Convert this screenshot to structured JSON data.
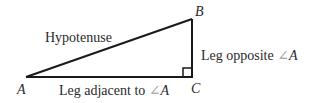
{
  "diagram": {
    "title": "",
    "vertices": [
      {
        "id": "A",
        "label": "A",
        "x": 26,
        "y": 77
      },
      {
        "id": "B",
        "label": "B",
        "x": 192,
        "y": 19
      },
      {
        "id": "C",
        "label": "C",
        "x": 192,
        "y": 77
      }
    ],
    "edges": [
      {
        "from": "A",
        "to": "B",
        "label": "Hypotenuse"
      },
      {
        "from": "B",
        "to": "C",
        "label_prefix": "Leg opposite ",
        "angle_symbol": "∠",
        "angle_vertex": "A"
      },
      {
        "from": "A",
        "to": "C",
        "label_prefix": "Leg adjacent to ",
        "angle_symbol": "∠",
        "angle_vertex": "A"
      }
    ],
    "right_angle_at": "C",
    "colors": {
      "line": "#1a1a1a",
      "text": "#2a2a2a",
      "angle_symbol": "#9a9a9a"
    }
  }
}
